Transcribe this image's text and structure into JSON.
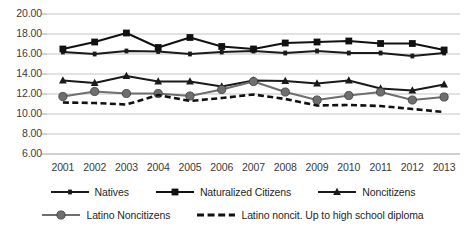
{
  "chart_data": {
    "type": "line",
    "title": "",
    "subtitle": "",
    "xlabel": "",
    "ylabel": "",
    "categories": [
      "2001",
      "2002",
      "2003",
      "2004",
      "2005",
      "2006",
      "2007",
      "2008",
      "2009",
      "2010",
      "2011",
      "2012",
      "2013"
    ],
    "ylim": [
      6.0,
      20.0
    ],
    "ytick_step": 2.0,
    "yticks": [
      "20.00",
      "18.00",
      "16.00",
      "14.00",
      "12.00",
      "10.00",
      "8.00",
      "6.00"
    ],
    "ytick_values": [
      20.0,
      18.0,
      16.0,
      14.0,
      12.0,
      10.0,
      8.0,
      6.0
    ],
    "grid": true,
    "grid_axis": "y",
    "legend_position": "bottom",
    "series": [
      {
        "name": "Natives",
        "marker": "small-square",
        "line_style": "solid",
        "color": "#1a1a1a",
        "values": [
          16.2,
          16.0,
          16.3,
          16.25,
          16.0,
          16.2,
          16.3,
          16.1,
          16.3,
          16.1,
          16.1,
          15.8,
          16.1
        ]
      },
      {
        "name": "Naturalized Citizens",
        "marker": "square",
        "line_style": "solid",
        "color": "#111111",
        "values": [
          16.5,
          17.2,
          18.1,
          16.65,
          17.65,
          16.75,
          16.5,
          17.1,
          17.2,
          17.3,
          17.05,
          17.05,
          16.4
        ]
      },
      {
        "name": "Noncitizens",
        "marker": "triangle",
        "line_style": "solid",
        "color": "#1a1a1a",
        "values": [
          13.35,
          13.1,
          13.8,
          13.25,
          13.25,
          12.75,
          13.35,
          13.3,
          13.05,
          13.35,
          12.55,
          12.35,
          12.95
        ]
      },
      {
        "name": "Latino  Noncitizens",
        "marker": "circle",
        "line_style": "solid",
        "color": "#6e6e6e",
        "values": [
          11.75,
          12.25,
          12.05,
          12.05,
          11.8,
          12.45,
          13.25,
          12.2,
          11.4,
          11.85,
          12.2,
          11.4,
          11.7
        ]
      },
      {
        "name": "Latino noncit. Up to high school diploma",
        "marker": "none",
        "line_style": "dashed",
        "color": "#1a1a1a",
        "values": [
          11.15,
          11.1,
          10.95,
          11.9,
          11.3,
          11.6,
          11.95,
          11.5,
          10.85,
          10.9,
          10.8,
          10.5,
          10.2
        ]
      }
    ]
  },
  "plot": {
    "left": 47,
    "right": 460,
    "top": 14,
    "bottom": 154,
    "grid_color": "#b5b5b5",
    "axis_color": "#9a9a9a"
  },
  "legend": {
    "row1": [
      "Natives",
      "Naturalized Citizens",
      "Noncitizens"
    ],
    "row2": [
      "Latino  Noncitizens",
      "Latino noncit. Up to high school diploma"
    ]
  },
  "caption": {
    "cut_off_text": ""
  }
}
